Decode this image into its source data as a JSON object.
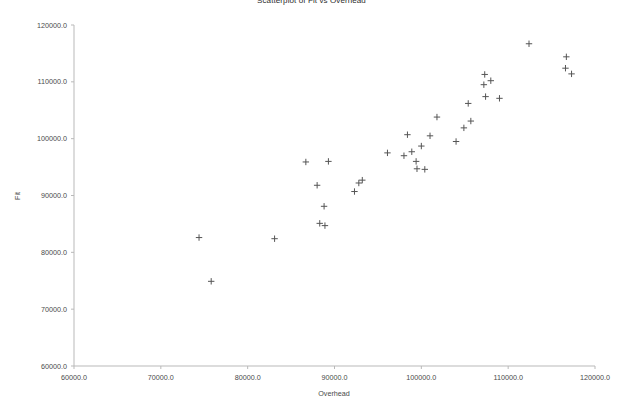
{
  "chart_data": {
    "type": "scatter",
    "title": "Scatterplot of Fit vs Overhead",
    "xlabel": "Overhead",
    "ylabel": "Fit",
    "xlim": [
      60000,
      120000
    ],
    "ylim": [
      60000,
      120000
    ],
    "xticks": [
      "60000.0",
      "70000.0",
      "80000.0",
      "90000.0",
      "100000.0",
      "110000.0",
      "120000.0"
    ],
    "yticks": [
      "60000.0",
      "70000.0",
      "80000.0",
      "90000.0",
      "100000.0",
      "110000.0",
      "120000.0"
    ],
    "xtick_values": [
      60000,
      70000,
      80000,
      90000,
      100000,
      110000,
      120000
    ],
    "ytick_values": [
      60000,
      70000,
      80000,
      90000,
      100000,
      110000,
      120000
    ],
    "grid": false,
    "legend": false,
    "marker": "plus",
    "marker_color": "#555555",
    "series": [
      {
        "name": "Fit vs Overhead",
        "points": [
          [
            74400,
            82600
          ],
          [
            75800,
            74900
          ],
          [
            83100,
            82400
          ],
          [
            86700,
            95900
          ],
          [
            88000,
            91800
          ],
          [
            88300,
            85100
          ],
          [
            88800,
            88100
          ],
          [
            88900,
            84700
          ],
          [
            89300,
            96000
          ],
          [
            92300,
            90700
          ],
          [
            92800,
            92200
          ],
          [
            93200,
            92700
          ],
          [
            96100,
            97500
          ],
          [
            98000,
            97000
          ],
          [
            98400,
            100700
          ],
          [
            98900,
            97700
          ],
          [
            99400,
            96000
          ],
          [
            99500,
            94700
          ],
          [
            100000,
            98700
          ],
          [
            100400,
            94600
          ],
          [
            101000,
            100500
          ],
          [
            101800,
            103800
          ],
          [
            104000,
            99500
          ],
          [
            104900,
            101900
          ],
          [
            105400,
            106200
          ],
          [
            105700,
            103100
          ],
          [
            107200,
            109500
          ],
          [
            107300,
            111300
          ],
          [
            107400,
            107400
          ],
          [
            108000,
            110200
          ],
          [
            109000,
            107100
          ],
          [
            112400,
            116700
          ],
          [
            116700,
            114400
          ],
          [
            116600,
            112400
          ],
          [
            117300,
            111400
          ]
        ]
      }
    ]
  }
}
